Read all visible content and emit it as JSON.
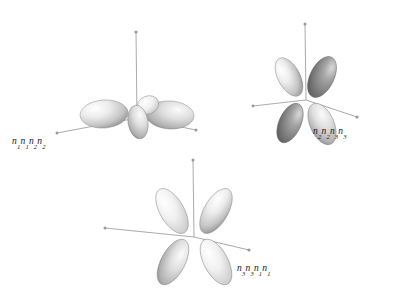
{
  "figure": {
    "type": "orbital-lobe-diagram",
    "background_color": "#ffffff",
    "axis_color": "#9a9a9a",
    "lobe_light_color": "#f2f2f2",
    "lobe_mid_color": "#c9c9c9",
    "lobe_dark_color": "#6e6e6e",
    "lobe_outline_color": "#8e8e8e",
    "text_color": "#1a1a1a"
  },
  "clusters": [
    {
      "id": "cluster-left",
      "name": "orbital-cluster-left",
      "label": "n1n1n2n2",
      "label_parts": [
        {
          "base": "n",
          "sub": "1"
        },
        {
          "base": "n",
          "sub": "1"
        },
        {
          "base": "n",
          "sub": "2"
        },
        {
          "base": "n",
          "sub": "2"
        }
      ],
      "lobe_count": 4,
      "orientation": "in-plane-flat"
    },
    {
      "id": "cluster-top-right",
      "name": "orbital-cluster-top-right",
      "label": "n2n2n3n3",
      "label_parts": [
        {
          "base": "n",
          "sub": "2"
        },
        {
          "base": "n",
          "sub": "2"
        },
        {
          "base": "n",
          "sub": "3"
        },
        {
          "base": "n",
          "sub": "3"
        }
      ],
      "lobe_count": 4,
      "orientation": "cloverleaf-tilted"
    },
    {
      "id": "cluster-bottom",
      "name": "orbital-cluster-bottom",
      "label": "n3n3n1n1",
      "label_parts": [
        {
          "base": "n",
          "sub": "3"
        },
        {
          "base": "n",
          "sub": "3"
        },
        {
          "base": "n",
          "sub": "1"
        },
        {
          "base": "n",
          "sub": "1"
        }
      ],
      "lobe_count": 4,
      "orientation": "cloverleaf-upright"
    }
  ]
}
